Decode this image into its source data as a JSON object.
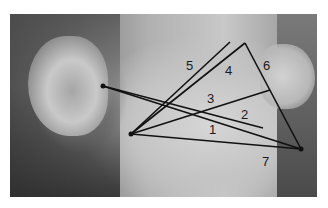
{
  "image": {
    "description": "Grayscale side profile photo of a face with facial measurement lines",
    "line_color": "#111111"
  },
  "points": {
    "tragus": [
      103,
      86
    ],
    "gonion": [
      131,
      134
    ],
    "chin": [
      301,
      149
    ]
  },
  "labels": [
    {
      "text": "1",
      "x": 209,
      "y": 123
    },
    {
      "text": "2",
      "x": 241,
      "y": 108
    },
    {
      "text": "3",
      "x": 207,
      "y": 92
    },
    {
      "text": "4",
      "x": 225,
      "y": 64
    },
    {
      "text": "5",
      "x": 186,
      "y": 59
    },
    {
      "text": "6",
      "x": 263,
      "y": 59
    },
    {
      "text": "7",
      "x": 262,
      "y": 155
    }
  ]
}
